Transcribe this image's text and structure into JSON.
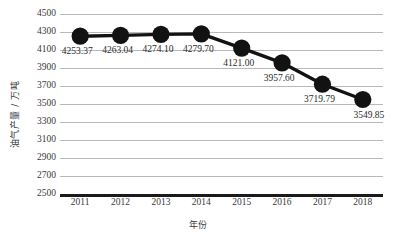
{
  "chart_data": {
    "type": "line",
    "title": "",
    "xlabel": "年份",
    "ylabel": "油气产量 / 万吨",
    "categories": [
      "2011",
      "2012",
      "2013",
      "2014",
      "2015",
      "2016",
      "2017",
      "2018"
    ],
    "values": [
      4253.37,
      4263.04,
      4274.1,
      4279.7,
      4121.0,
      3957.6,
      3719.79,
      3549.85
    ],
    "point_labels": [
      "4253.37",
      "4263.04",
      "4274.10",
      "4279.70",
      "4121.00",
      "3957.60",
      "3719.79",
      "3549.85"
    ],
    "ylim": [
      2500,
      4500
    ],
    "ytick_values": [
      2500,
      2700,
      2900,
      3100,
      3300,
      3500,
      3700,
      3900,
      4100,
      4300,
      4500
    ],
    "ytick_labels": [
      "2500",
      "2700",
      "2900",
      "3100",
      "3300",
      "3500",
      "3700",
      "3900",
      "4100",
      "4300",
      "4500"
    ],
    "grid": true,
    "legend": false,
    "series_color": "#121212",
    "grid_color": "#b9b9b9",
    "axis_color": "#1a1a1a",
    "marker": "circle"
  }
}
